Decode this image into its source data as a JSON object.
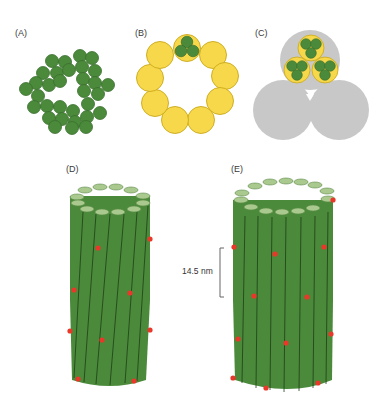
{
  "panels": {
    "a": {
      "label": "(A)"
    },
    "b": {
      "label": "(B)"
    },
    "c": {
      "label": "(C)"
    },
    "d": {
      "label": "(D)"
    },
    "e": {
      "label": "(E)"
    }
  },
  "scale_bar": {
    "label": "14.5 nm"
  },
  "colors": {
    "green": "#4a8a3a",
    "green_dark": "#2f5f25",
    "green_top": "#a9c98e",
    "yellow": "#f7d84a",
    "yellow_edge": "#c9a81a",
    "gray": "#c8c8c8",
    "red": "#e8382a"
  }
}
